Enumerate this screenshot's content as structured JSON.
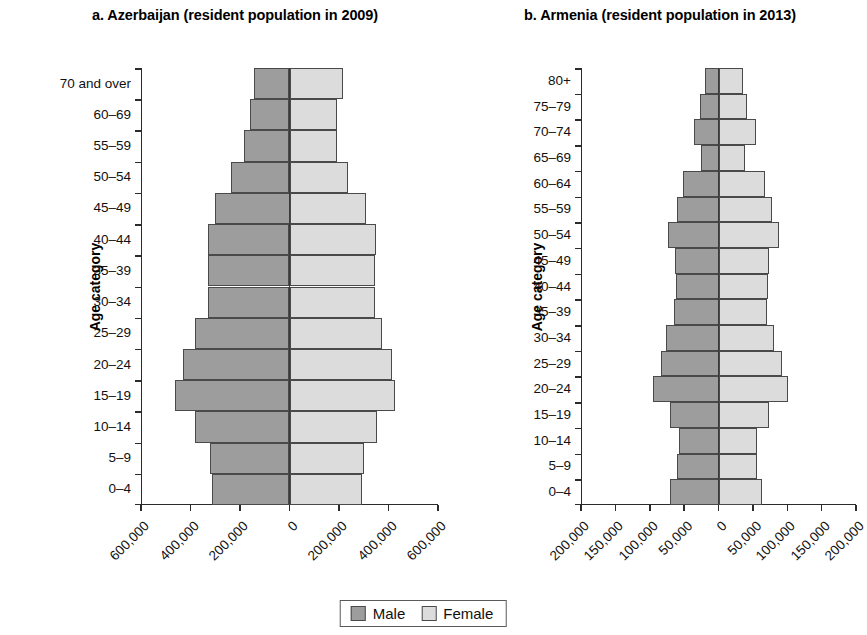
{
  "legend": {
    "male_label": "Male",
    "female_label": "Female",
    "male_color": "#9d9d9d",
    "female_color": "#dcdcdc"
  },
  "panels": [
    {
      "key": "azerbaijan",
      "title": "a. Azerbaijan (resident population in 2009)",
      "ylabel": "Age category"
    },
    {
      "key": "armenia",
      "title": "b. Armenia (resident population in 2013)",
      "ylabel": "Age category"
    }
  ],
  "chart_data": [
    {
      "type": "bar",
      "subtype": "population-pyramid",
      "title": "a. Azerbaijan (resident population in 2009)",
      "xlabel": "",
      "ylabel": "Age category",
      "xlim": [
        -600000,
        600000
      ],
      "xticks": [
        -600000,
        -400000,
        -200000,
        0,
        200000,
        400000,
        600000
      ],
      "xticklabels": [
        "600,000",
        "400,000",
        "200,000",
        "0",
        "200,000",
        "400,000",
        "600,000"
      ],
      "grid": false,
      "legend_position": "bottom-center",
      "categories": [
        "70 and over",
        "60–69",
        "55–59",
        "50–54",
        "45–49",
        "40–44",
        "35–39",
        "30–34",
        "25–29",
        "20–24",
        "15–19",
        "10–14",
        "5–9",
        "0–4"
      ],
      "series": [
        {
          "name": "Male",
          "color": "#9d9d9d",
          "values": [
            144000,
            160000,
            185000,
            238000,
            300000,
            331000,
            330000,
            331000,
            383000,
            430000,
            464000,
            382000,
            320000,
            313000
          ]
        },
        {
          "name": "Female",
          "color": "#dcdcdc",
          "values": [
            216000,
            190000,
            190000,
            238000,
            310000,
            351000,
            345000,
            345000,
            375000,
            413000,
            428000,
            355000,
            300000,
            292000
          ]
        }
      ]
    },
    {
      "type": "bar",
      "subtype": "population-pyramid",
      "title": "b. Armenia (resident population in 2013)",
      "xlabel": "",
      "ylabel": "Age category",
      "xlim": [
        -200000,
        200000
      ],
      "xticks": [
        -200000,
        -150000,
        -100000,
        -50000,
        0,
        50000,
        100000,
        150000,
        200000
      ],
      "xticklabels": [
        "200,000",
        "150,000",
        "100,000",
        "50,000",
        "0",
        "50,000",
        "100,000",
        "150,000",
        "200,000"
      ],
      "grid": false,
      "legend_position": "bottom-center",
      "categories": [
        "80+",
        "75–79",
        "70–74",
        "65–69",
        "60–64",
        "55–59",
        "50–54",
        "45–49",
        "40–44",
        "35–39",
        "30–34",
        "25–29",
        "20–24",
        "15–19",
        "10–14",
        "5–9",
        "0–4"
      ],
      "series": [
        {
          "name": "Male",
          "color": "#9d9d9d",
          "values": [
            19000,
            27000,
            36000,
            26000,
            51000,
            61000,
            73000,
            63000,
            62000,
            65000,
            76000,
            83000,
            96000,
            70000,
            57000,
            60000,
            71000
          ]
        },
        {
          "name": "Female",
          "color": "#dcdcdc",
          "values": [
            36000,
            41000,
            55000,
            38000,
            68000,
            78000,
            88000,
            73000,
            72000,
            71000,
            80000,
            93000,
            101000,
            73000,
            56000,
            56000,
            63000
          ]
        }
      ]
    }
  ]
}
